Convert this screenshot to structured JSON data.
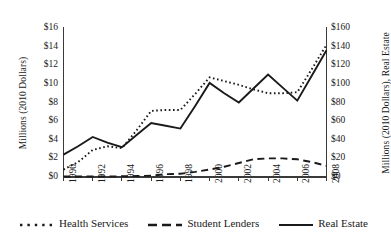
{
  "chart_data": {
    "type": "line",
    "title": "",
    "xlabel": "",
    "ylabel": "Millions (2010 Dollars)",
    "ylabel_right": "Millions (2010 Dollars), Real Estate",
    "grid": false,
    "legend_position": "bottom",
    "x": [
      1990,
      1991,
      1992,
      1993,
      1994,
      1995,
      1996,
      1997,
      1998,
      1999,
      2000,
      2001,
      2002,
      2003,
      2004,
      2005,
      2006,
      2007,
      2008
    ],
    "xtick_labels": [
      "1990",
      "1992",
      "1994",
      "1996",
      "1998",
      "2000",
      "2002",
      "2004",
      "2006",
      "2008"
    ],
    "xtick_values": [
      1990,
      1992,
      1994,
      1996,
      1998,
      2000,
      2002,
      2004,
      2006,
      2008
    ],
    "xlim": [
      1990,
      2008
    ],
    "ylim": [
      0,
      16
    ],
    "ytick_labels": [
      "$0",
      "$2",
      "$4",
      "$6",
      "$8",
      "$10",
      "$12",
      "$14",
      "$16"
    ],
    "ytick_values": [
      0,
      2,
      4,
      6,
      8,
      10,
      12,
      14,
      16
    ],
    "ylim_right": [
      0,
      160
    ],
    "ytick_labels_right": [
      "$0",
      "$20",
      "$40",
      "$60",
      "$80",
      "$100",
      "$120",
      "$140",
      "$160"
    ],
    "ytick_values_right": [
      0,
      20,
      40,
      60,
      80,
      100,
      120,
      140,
      160
    ],
    "series": [
      {
        "name": "Health Services",
        "axis": "left",
        "style": "dotted",
        "color": "#1a1a1a",
        "values": [
          0.8,
          1.6,
          2.9,
          3.3,
          3.1,
          5.0,
          7.1,
          7.2,
          7.2,
          8.9,
          10.7,
          10.3,
          9.9,
          9.4,
          9.0,
          9.0,
          9.1,
          11.6,
          14.2
        ]
      },
      {
        "name": "Student Lenders",
        "axis": "left",
        "style": "dashed",
        "color": "#1a1a1a",
        "values": [
          0.05,
          0.05,
          0.05,
          0.05,
          0.08,
          0.1,
          0.15,
          0.3,
          0.35,
          0.55,
          0.8,
          1.1,
          1.5,
          1.9,
          2.0,
          2.0,
          1.9,
          1.6,
          1.2
        ]
      },
      {
        "name": "Real Estate",
        "axis": "right",
        "style": "solid",
        "color": "#1a1a1a",
        "values": [
          24,
          33,
          43,
          37,
          32,
          45,
          58,
          55,
          52,
          76,
          101,
          90,
          80,
          95,
          110,
          96,
          82,
          109,
          136
        ]
      }
    ]
  },
  "legend": {
    "items": [
      {
        "label": "Health Services",
        "style": "dotted"
      },
      {
        "label": "Student Lenders",
        "style": "dashed"
      },
      {
        "label": "Real Estate",
        "style": "solid"
      }
    ]
  }
}
